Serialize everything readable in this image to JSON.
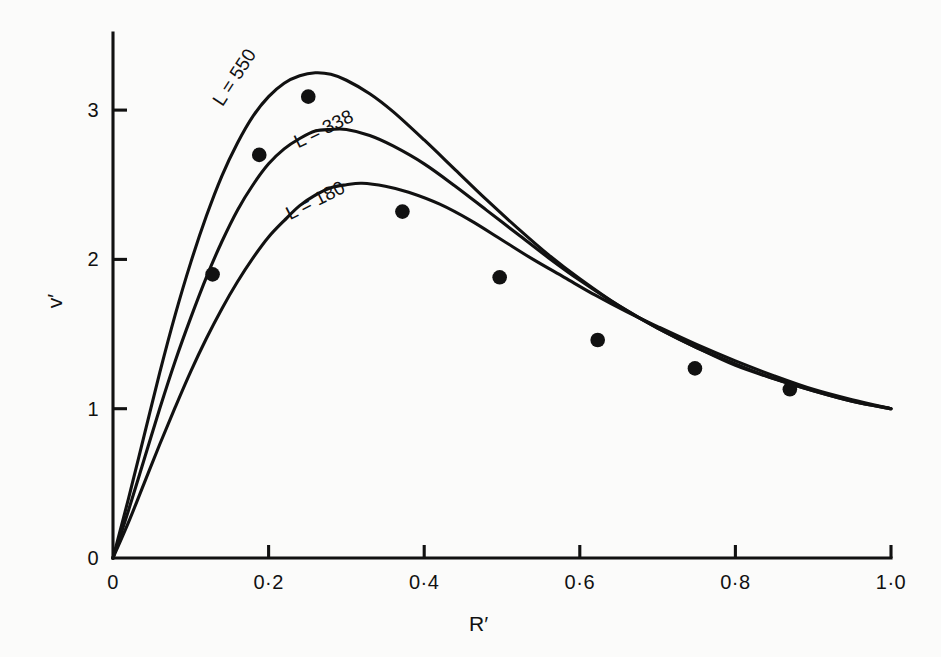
{
  "chart_data": {
    "type": "line",
    "title": "",
    "subtitle": "",
    "xlabel": "R′",
    "ylabel": "v′",
    "xlim": [
      0,
      1.0
    ],
    "ylim": [
      0,
      3.52
    ],
    "grid": false,
    "legend_position": "inline-curve-labels",
    "x_ticks": [
      {
        "value": 0,
        "label": "0"
      },
      {
        "value": 0.2,
        "label": "0·2"
      },
      {
        "value": 0.4,
        "label": "0·4"
      },
      {
        "value": 0.6,
        "label": "0·6"
      },
      {
        "value": 0.8,
        "label": "0·8"
      },
      {
        "value": 1.0,
        "label": "1·0"
      }
    ],
    "y_ticks": [
      {
        "value": 0,
        "label": "0"
      },
      {
        "value": 1,
        "label": "1"
      },
      {
        "value": 2,
        "label": "2"
      },
      {
        "value": 3,
        "label": "3"
      }
    ],
    "series": [
      {
        "name": "L = 550",
        "label": "L = 550",
        "label_x": 0.175,
        "label_y": 3.04,
        "label_rotation": -57,
        "color": "#111111",
        "points": [
          [
            0.0,
            0.0
          ],
          [
            0.02,
            0.4
          ],
          [
            0.04,
            0.82
          ],
          [
            0.06,
            1.24
          ],
          [
            0.08,
            1.63
          ],
          [
            0.1,
            1.98
          ],
          [
            0.12,
            2.29
          ],
          [
            0.14,
            2.56
          ],
          [
            0.16,
            2.78
          ],
          [
            0.18,
            2.96
          ],
          [
            0.2,
            3.09
          ],
          [
            0.22,
            3.18
          ],
          [
            0.24,
            3.23
          ],
          [
            0.26,
            3.25
          ],
          [
            0.28,
            3.24
          ],
          [
            0.3,
            3.2
          ],
          [
            0.33,
            3.11
          ],
          [
            0.36,
            2.99
          ],
          [
            0.4,
            2.8
          ],
          [
            0.44,
            2.6
          ],
          [
            0.48,
            2.4
          ],
          [
            0.52,
            2.21
          ],
          [
            0.56,
            2.03
          ],
          [
            0.6,
            1.87
          ],
          [
            0.65,
            1.69
          ],
          [
            0.7,
            1.54
          ],
          [
            0.75,
            1.41
          ],
          [
            0.8,
            1.29
          ],
          [
            0.85,
            1.2
          ],
          [
            0.9,
            1.12
          ],
          [
            0.95,
            1.05
          ],
          [
            1.0,
            1.0
          ]
        ]
      },
      {
        "name": "L = 338",
        "label": "L = 338",
        "label_x": 0.275,
        "label_y": 2.78,
        "label_rotation": -26,
        "color": "#111111",
        "points": [
          [
            0.0,
            0.0
          ],
          [
            0.02,
            0.32
          ],
          [
            0.04,
            0.66
          ],
          [
            0.06,
            1.0
          ],
          [
            0.08,
            1.32
          ],
          [
            0.1,
            1.61
          ],
          [
            0.12,
            1.88
          ],
          [
            0.14,
            2.12
          ],
          [
            0.16,
            2.33
          ],
          [
            0.18,
            2.5
          ],
          [
            0.2,
            2.64
          ],
          [
            0.22,
            2.74
          ],
          [
            0.24,
            2.81
          ],
          [
            0.26,
            2.86
          ],
          [
            0.28,
            2.87
          ],
          [
            0.3,
            2.87
          ],
          [
            0.33,
            2.83
          ],
          [
            0.36,
            2.76
          ],
          [
            0.4,
            2.64
          ],
          [
            0.44,
            2.49
          ],
          [
            0.48,
            2.33
          ],
          [
            0.52,
            2.17
          ],
          [
            0.56,
            2.01
          ],
          [
            0.6,
            1.86
          ],
          [
            0.65,
            1.69
          ],
          [
            0.7,
            1.54
          ],
          [
            0.75,
            1.41
          ],
          [
            0.8,
            1.3
          ],
          [
            0.85,
            1.2
          ],
          [
            0.9,
            1.12
          ],
          [
            0.95,
            1.05
          ],
          [
            1.0,
            1.0
          ]
        ]
      },
      {
        "name": "L = 180",
        "label": "L = 180",
        "label_x": 0.265,
        "label_y": 2.3,
        "label_rotation": -27,
        "color": "#111111",
        "points": [
          [
            0.0,
            0.0
          ],
          [
            0.02,
            0.24
          ],
          [
            0.04,
            0.5
          ],
          [
            0.06,
            0.76
          ],
          [
            0.08,
            1.01
          ],
          [
            0.1,
            1.25
          ],
          [
            0.12,
            1.47
          ],
          [
            0.14,
            1.67
          ],
          [
            0.16,
            1.85
          ],
          [
            0.18,
            2.01
          ],
          [
            0.2,
            2.15
          ],
          [
            0.22,
            2.26
          ],
          [
            0.24,
            2.36
          ],
          [
            0.26,
            2.43
          ],
          [
            0.28,
            2.48
          ],
          [
            0.3,
            2.5
          ],
          [
            0.32,
            2.51
          ],
          [
            0.35,
            2.49
          ],
          [
            0.38,
            2.45
          ],
          [
            0.42,
            2.37
          ],
          [
            0.46,
            2.26
          ],
          [
            0.5,
            2.13
          ],
          [
            0.54,
            2.0
          ],
          [
            0.58,
            1.88
          ],
          [
            0.62,
            1.76
          ],
          [
            0.66,
            1.65
          ],
          [
            0.7,
            1.55
          ],
          [
            0.75,
            1.43
          ],
          [
            0.8,
            1.32
          ],
          [
            0.85,
            1.22
          ],
          [
            0.9,
            1.13
          ],
          [
            0.95,
            1.06
          ],
          [
            1.0,
            1.0
          ]
        ]
      }
    ],
    "scatter": {
      "name": "measured points",
      "marker": "filled-circle",
      "color": "#111111",
      "points": [
        [
          0.128,
          1.9
        ],
        [
          0.188,
          2.7
        ],
        [
          0.251,
          3.09
        ],
        [
          0.372,
          2.32
        ],
        [
          0.497,
          1.88
        ],
        [
          0.623,
          1.46
        ],
        [
          0.748,
          1.27
        ],
        [
          0.87,
          1.13
        ]
      ]
    }
  },
  "axes": {
    "x_title": "R′",
    "y_title": "v′"
  }
}
